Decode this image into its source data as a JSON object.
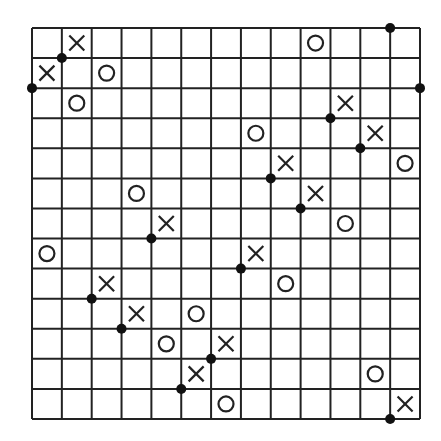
{
  "puzzle": {
    "cols": 13,
    "rows": 13,
    "colors": {
      "line": "#222222",
      "mark": "#222222",
      "dot": "#111111",
      "background": "#ffffff"
    },
    "crosses": [
      [
        1,
        0
      ],
      [
        0,
        1
      ],
      [
        10,
        2
      ],
      [
        11,
        3
      ],
      [
        8,
        4
      ],
      [
        9,
        5
      ],
      [
        4,
        6
      ],
      [
        7,
        7
      ],
      [
        2,
        8
      ],
      [
        3,
        9
      ],
      [
        6,
        10
      ],
      [
        5,
        11
      ],
      [
        12,
        12
      ]
    ],
    "circles": [
      [
        9,
        0
      ],
      [
        2,
        1
      ],
      [
        1,
        2
      ],
      [
        7,
        3
      ],
      [
        12,
        4
      ],
      [
        3,
        5
      ],
      [
        10,
        6
      ],
      [
        0,
        7
      ],
      [
        8,
        8
      ],
      [
        5,
        9
      ],
      [
        4,
        10
      ],
      [
        11,
        11
      ],
      [
        6,
        12
      ]
    ],
    "dots": [
      [
        12,
        0
      ],
      [
        1,
        1
      ],
      [
        0,
        2
      ],
      [
        13,
        2
      ],
      [
        10,
        3
      ],
      [
        11,
        4
      ],
      [
        8,
        5
      ],
      [
        9,
        6
      ],
      [
        4,
        7
      ],
      [
        7,
        8
      ],
      [
        2,
        9
      ],
      [
        3,
        10
      ],
      [
        6,
        11
      ],
      [
        5,
        12
      ],
      [
        12,
        13
      ]
    ]
  }
}
